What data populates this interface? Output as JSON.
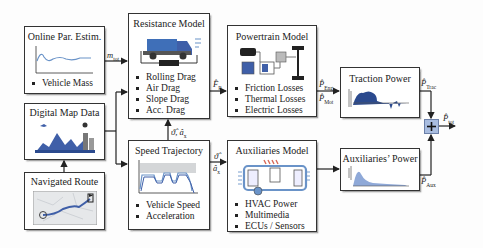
{
  "blocks": {
    "online_estimation": {
      "title": "Online Par. Estim.",
      "bullets": [
        "Vehicle Mass"
      ]
    },
    "digital_map": {
      "title": "Digital Map Data"
    },
    "navigated_route": {
      "title": "Navigated Route"
    },
    "resistance_model": {
      "title": "Resistance Model",
      "bullets": [
        "Rolling Drag",
        "Air Drag",
        "Slope Drag",
        "Acc. Drag"
      ]
    },
    "speed_trajectory": {
      "title": "Speed Trajectory",
      "bullets": [
        "Vehicle Speed",
        "Acceleration"
      ]
    },
    "powertrain_model": {
      "title": "Powertrain Model",
      "bullets": [
        "Friction Losses",
        "Thermal Losses",
        "Electric Losses"
      ]
    },
    "auxiliaries_model": {
      "title": "Auxiliaries Model",
      "bullets": [
        "HVAC Power",
        "Multimedia",
        "ECUs / Sensors"
      ]
    },
    "traction_power": {
      "title": "Traction Power"
    },
    "auxiliaries_power": {
      "title": "Auxiliaries’ Power"
    },
    "sum": {
      "symbol": "+"
    }
  },
  "signals": {
    "mass": {
      "main": "m",
      "sub": "tot"
    },
    "force": {
      "main": "F̂",
      "sub": "R"
    },
    "speed_acc_up": {
      "main": "ϑ̂, â",
      "sub": "x"
    },
    "speed_right_top": {
      "main": "ϑ̂"
    },
    "speed_right_bottom": {
      "main": "â",
      "sub": "x"
    },
    "p_eng": {
      "main": "P̂",
      "sub": "Eng"
    },
    "p_mot": {
      "main": "P̂",
      "sub": "Mot"
    },
    "p_trac": {
      "main": "P̂",
      "sub": "Trac"
    },
    "p_aux": {
      "main": "P̂",
      "sub": "Aux"
    },
    "p_tot": {
      "main": "P̂",
      "sub": "tot"
    }
  },
  "colors": {
    "accent_blue": "#3f5fa8",
    "light_blue": "#a9bde0",
    "line": "#222222"
  }
}
